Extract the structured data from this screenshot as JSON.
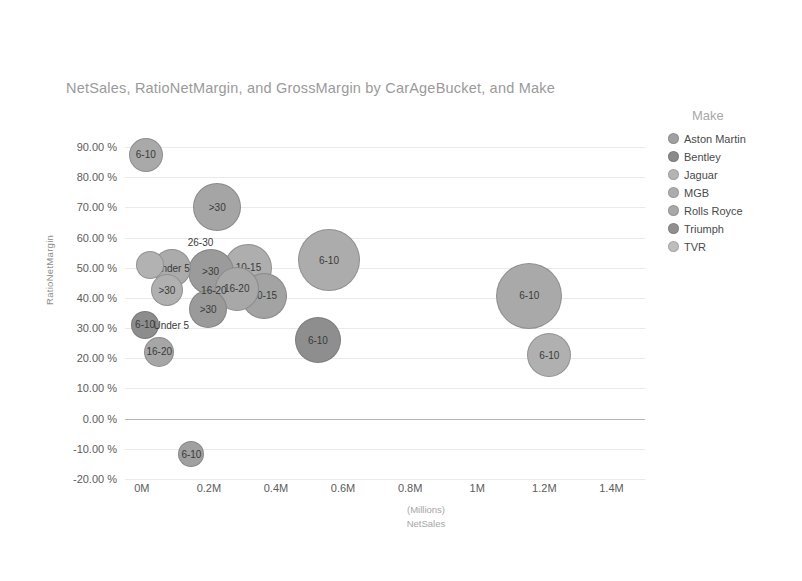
{
  "title": "NetSales, RatioNetMargin, and GrossMargin by CarAgeBucket, and Make",
  "legend": {
    "title": "Make",
    "items": [
      {
        "label": "Aston Martin",
        "color": "#a0a0a0"
      },
      {
        "label": "Bentley",
        "color": "#8a8a8a"
      },
      {
        "label": "Jaguar",
        "color": "#b4b4b4"
      },
      {
        "label": "MGB",
        "color": "#adadad"
      },
      {
        "label": "Rolls Royce",
        "color": "#a8a8a8"
      },
      {
        "label": "Triumph",
        "color": "#909090"
      },
      {
        "label": "TVR",
        "color": "#bdbdbd"
      }
    ]
  },
  "chart_data": {
    "type": "scatter",
    "title": "NetSales, RatioNetMargin, and GrossMargin by CarAgeBucket, and Make",
    "xlabel": "NetSales",
    "xunit": "(Millions)",
    "ylabel": "RatioNetMargin",
    "xlim": [
      -0.05,
      1.5
    ],
    "ylim": [
      -0.2,
      0.95
    ],
    "grid": true,
    "legend_position": "right",
    "xticks": [
      "0M",
      "0.2M",
      "0.4M",
      "0.6M",
      "0.8M",
      "1M",
      "1.2M",
      "1.4M"
    ],
    "xtick_values": [
      0,
      0.2,
      0.4,
      0.6,
      0.8,
      1.0,
      1.2,
      1.4
    ],
    "yticks": [
      "90.00 %",
      "80.00 %",
      "70.00 %",
      "60.00 %",
      "50.00 %",
      "40.00 %",
      "30.00 %",
      "20.00 %",
      "10.00 %",
      "0.00 %",
      "-10.00 %",
      "-20.00 %"
    ],
    "ytick_values": [
      0.9,
      0.8,
      0.7,
      0.6,
      0.5,
      0.4,
      0.3,
      0.2,
      0.1,
      0.0,
      -0.1,
      -0.2
    ],
    "size_measure": "GrossMargin",
    "points": [
      {
        "label": "6-10",
        "x": 0.012,
        "y": 0.875,
        "r": 17,
        "color": "#a9a9a9",
        "make": "TVR"
      },
      {
        "label": ">30",
        "x": 0.225,
        "y": 0.7,
        "r": 24,
        "color": "#a5a5a5",
        "make": "Rolls Royce"
      },
      {
        "label": "26-30",
        "x": 0.175,
        "y": 0.585,
        "r": 0,
        "color": "#a5a5a5",
        "make": "MGB",
        "text_only": true
      },
      {
        "label": "",
        "x": 0.025,
        "y": 0.51,
        "r": 14,
        "color": "#b2b2b2",
        "make": "Jaguar"
      },
      {
        "label": "Under 5",
        "x": 0.09,
        "y": 0.498,
        "r": 19,
        "color": "#ababab",
        "make": "MGB"
      },
      {
        "label": ">30",
        "x": 0.205,
        "y": 0.487,
        "r": 23,
        "color": "#9b9b9b",
        "make": "Aston Martin"
      },
      {
        "label": "10-15",
        "x": 0.318,
        "y": 0.5,
        "r": 24,
        "color": "#aeaeae",
        "make": "Jaguar"
      },
      {
        "label": "6-10",
        "x": 0.558,
        "y": 0.525,
        "r": 31,
        "color": "#acacac",
        "make": "Rolls Royce"
      },
      {
        "label": "16-20",
        "x": 0.283,
        "y": 0.43,
        "r": 22,
        "color": "#a8a8a8",
        "make": "MGB"
      },
      {
        "label": "10-15",
        "x": 0.365,
        "y": 0.408,
        "r": 23,
        "color": "#a3a3a3",
        "make": "Jaguar"
      },
      {
        "label": ">30",
        "x": 0.075,
        "y": 0.425,
        "r": 16,
        "color": "#b0b0b0",
        "make": "Aston Martin"
      },
      {
        "label": "16-20",
        "x": 0.215,
        "y": 0.428,
        "r": 0,
        "color": "#a8a8a8",
        "make": "MGB",
        "text_only": true
      },
      {
        "label": ">30",
        "x": 0.198,
        "y": 0.363,
        "r": 19,
        "color": "#9a9a9a",
        "make": "Triumph"
      },
      {
        "label": "6-10",
        "x": 1.155,
        "y": 0.408,
        "r": 33,
        "color": "#a9a9a9",
        "make": "Rolls Royce"
      },
      {
        "label": "6-10",
        "x": 0.01,
        "y": 0.312,
        "r": 14,
        "color": "#8d8d8d",
        "make": "Bentley"
      },
      {
        "label": "Under 5",
        "x": 0.088,
        "y": 0.312,
        "r": 0,
        "color": "#ababab",
        "make": "MGB",
        "text_only": true
      },
      {
        "label": "6-10",
        "x": 0.525,
        "y": 0.26,
        "r": 23,
        "color": "#8e8e8e",
        "make": "Bentley"
      },
      {
        "label": "16-20",
        "x": 0.052,
        "y": 0.222,
        "r": 15,
        "color": "#a6a6a6",
        "make": "MGB"
      },
      {
        "label": "6-10",
        "x": 1.215,
        "y": 0.21,
        "r": 22,
        "color": "#b0b0b0",
        "make": "TVR"
      },
      {
        "label": "6-10",
        "x": 0.148,
        "y": -0.118,
        "r": 13,
        "color": "#a0a0a0",
        "make": "Triumph"
      }
    ]
  }
}
